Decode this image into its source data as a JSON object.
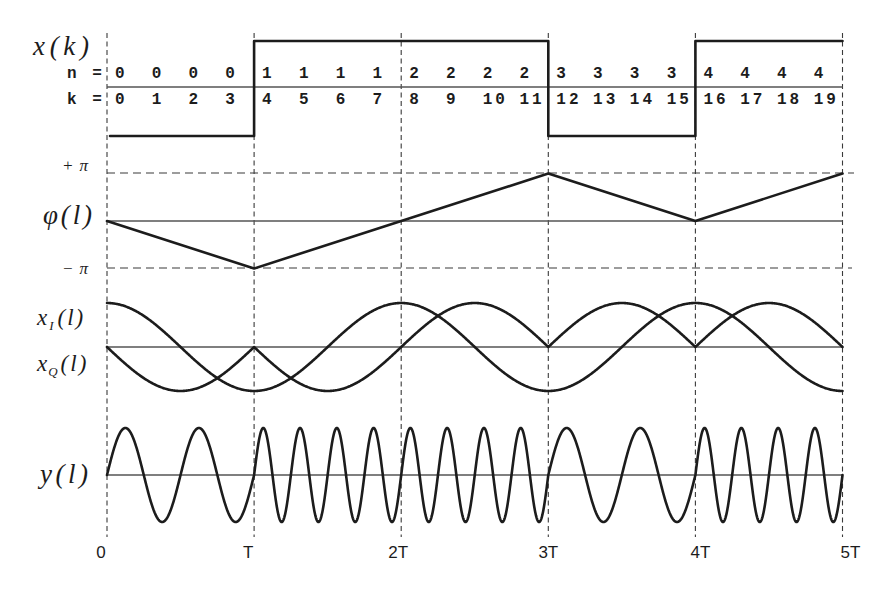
{
  "chart_data": {
    "type": "line",
    "title": "",
    "xlabel": "",
    "x_ticks": [
      "0",
      "T",
      "2T",
      "3T",
      "4T",
      "5T"
    ],
    "x_tick_values": [
      0,
      1,
      2,
      3,
      4,
      5
    ],
    "x_range": [
      0,
      5
    ],
    "grid": "vertical dashed lines at multiples of T",
    "panels": {
      "xk": {
        "ylabel": "x(k)",
        "type": "step",
        "interval_starts": [
          0,
          1,
          2,
          3,
          4
        ],
        "values": [
          -1,
          1,
          1,
          -1,
          1
        ],
        "ylim": [
          -1,
          1
        ],
        "table": {
          "n_label": "n =",
          "k_label": "k =",
          "n": [
            "0",
            "0",
            "0",
            "0",
            "1",
            "1",
            "1",
            "1",
            "2",
            "2",
            "2",
            "2",
            "3",
            "3",
            "3",
            "3",
            "4",
            "4",
            "4",
            "4"
          ],
          "k": [
            "0",
            "1",
            "2",
            "3",
            "4",
            "5",
            "6",
            "7",
            "8",
            "9",
            "10",
            "11",
            "12",
            "13",
            "14",
            "15",
            "16",
            "17",
            "18",
            "19"
          ]
        }
      },
      "phase": {
        "ylabel": "φ(l)",
        "type": "line",
        "x": [
          0,
          1,
          2,
          3,
          4,
          5
        ],
        "values_over_pi": [
          0,
          -1,
          0,
          1,
          0,
          1
        ],
        "ytick_labels": {
          "top": "+π",
          "bottom": "−π"
        },
        "ylim_over_pi": [
          -1,
          1
        ]
      },
      "iq": {
        "type": "line",
        "i_label": {
          "base": "x",
          "sub": "I",
          "arg": "(l)"
        },
        "q_label": {
          "base": "x",
          "sub": "Q",
          "arg": "(l)"
        },
        "ylim": [
          -1,
          1
        ],
        "series": [
          {
            "name": "x_I(l)",
            "x": [
              0,
              0.5,
              1,
              1.5,
              2,
              2.5,
              3,
              3.5,
              4,
              4.5,
              5
            ],
            "values": [
              1,
              0,
              -1,
              0,
              1,
              0,
              -1,
              0,
              1,
              0,
              -1
            ]
          },
          {
            "name": "x_Q(l)",
            "x": [
              0,
              0.5,
              1,
              1.5,
              2,
              2.5,
              3,
              3.5,
              4,
              4.5,
              5
            ],
            "values": [
              0,
              -1,
              0,
              -1,
              0,
              1,
              0,
              1,
              0,
              1,
              0
            ]
          }
        ]
      },
      "y": {
        "ylabel": "y(l)",
        "type": "line",
        "cycles_per_interval": [
          2,
          4,
          4,
          2,
          4
        ],
        "ylim": [
          -1,
          1
        ]
      }
    }
  }
}
